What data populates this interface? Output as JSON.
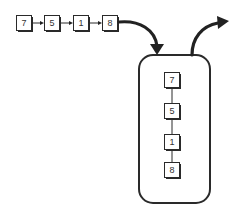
{
  "diagram": {
    "colors": {
      "stroke": "#2a2a2a",
      "background": "#ffffff",
      "text": "#333333"
    },
    "queue": {
      "nodes": [
        {
          "label": "7",
          "x": 16,
          "y": 15
        },
        {
          "label": "5",
          "x": 44,
          "y": 15
        },
        {
          "label": "1",
          "x": 73,
          "y": 15
        },
        {
          "label": "8",
          "x": 102,
          "y": 15
        }
      ]
    },
    "stack": {
      "container": {
        "x": 139,
        "y": 55,
        "width": 71,
        "height": 148,
        "radius": 14
      },
      "nodes": [
        {
          "label": "7",
          "x": 164,
          "y": 72
        },
        {
          "label": "5",
          "x": 164,
          "y": 103
        },
        {
          "label": "1",
          "x": 164,
          "y": 134
        },
        {
          "label": "8",
          "x": 164,
          "y": 162
        }
      ]
    },
    "arrows": {
      "push": "in-arrow",
      "pop": "out-arrow"
    }
  }
}
